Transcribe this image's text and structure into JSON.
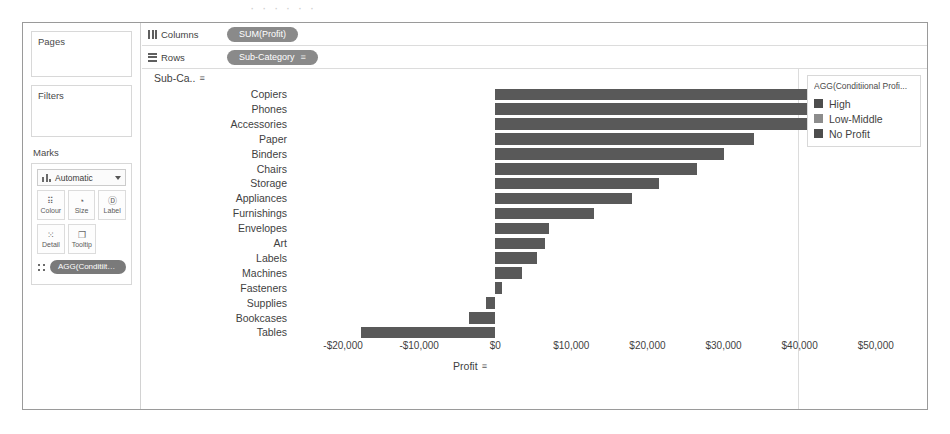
{
  "page_remnant": "· · · · · ·",
  "sidebar": {
    "pages_label": "Pages",
    "filters_label": "Filters",
    "marks_label": "Marks",
    "mark_type": "Automatic",
    "buttons": [
      {
        "label": "Colour",
        "icon": "colour-icon",
        "glyph": "⠿"
      },
      {
        "label": "Size",
        "icon": "size-icon",
        "glyph": "◔"
      },
      {
        "label": "Label",
        "icon": "label-icon",
        "glyph": "Ⓓ"
      },
      {
        "label": "Detail",
        "icon": "detail-icon",
        "glyph": "⁙"
      },
      {
        "label": "Tooltip",
        "icon": "tooltip-icon",
        "glyph": "❐"
      }
    ],
    "marks_pill": "AGG(Conditiito..."
  },
  "shelves": {
    "columns_label": "Columns",
    "columns_pill": "SUM(Profit)",
    "rows_label": "Rows",
    "rows_pill": "Sub-Category",
    "sort_glyph": "≡"
  },
  "view": {
    "field_header": "Sub-Ca..",
    "sort_glyph": "≡"
  },
  "legend": {
    "title": "AGG(Conditiional Profi...",
    "items": [
      {
        "label": "High",
        "color": "#4d4d4d"
      },
      {
        "label": "Low-Middle",
        "color": "#8c8c8c"
      },
      {
        "label": "No Profit",
        "color": "#4d4d4d"
      }
    ]
  },
  "chart_data": {
    "type": "bar",
    "orientation": "horizontal",
    "title": "",
    "xlabel": "Profit",
    "ylabel": "Sub-Category",
    "xlim": [
      -25000,
      57000
    ],
    "xticks": [
      -20000,
      -10000,
      0,
      10000,
      20000,
      30000,
      40000,
      50000
    ],
    "xticklabels": [
      "-$20,000",
      "-$10,000",
      "$0",
      "$10,000",
      "$20,000",
      "$30,000",
      "$40,000",
      "$50,000"
    ],
    "grid": false,
    "categories": [
      "Copiers",
      "Phones",
      "Accessories",
      "Paper",
      "Binders",
      "Chairs",
      "Storage",
      "Appliances",
      "Furnishings",
      "Envelopes",
      "Art",
      "Labels",
      "Machines",
      "Fasteners",
      "Supplies",
      "Bookcases",
      "Tables"
    ],
    "values": [
      53000,
      43000,
      41000,
      34000,
      30000,
      26500,
      21500,
      18000,
      13000,
      7000,
      6500,
      5500,
      3500,
      950,
      -1200,
      -3500,
      -17700
    ],
    "colors": [
      "#595959",
      "#595959",
      "#595959",
      "#595959",
      "#595959",
      "#595959",
      "#595959",
      "#595959",
      "#595959",
      "#595959",
      "#595959",
      "#595959",
      "#595959",
      "#595959",
      "#595959",
      "#595959",
      "#595959"
    ],
    "legend_position": "right"
  }
}
